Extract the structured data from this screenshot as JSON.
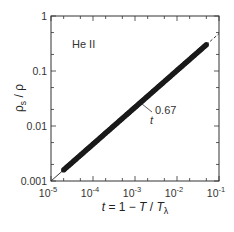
{
  "chart_data": {
    "type": "scatter",
    "title": "",
    "xlabel": "t = 1 − T / Tλ",
    "ylabel": "ρs / ρ",
    "xscale": "log",
    "yscale": "log",
    "xlim": [
      1e-05,
      0.1
    ],
    "ylim": [
      0.001,
      1
    ],
    "grid": false,
    "x_ticks": [
      {
        "value": 1e-05,
        "base": "10",
        "exp": "-5"
      },
      {
        "value": 0.0001,
        "base": "10",
        "exp": "-4"
      },
      {
        "value": 0.001,
        "base": "10",
        "exp": "-3"
      },
      {
        "value": 0.01,
        "base": "10",
        "exp": "-2"
      },
      {
        "value": 0.1,
        "base": "10",
        "exp": "-1"
      }
    ],
    "y_ticks": [
      {
        "value": 0.001,
        "label": "0.001"
      },
      {
        "value": 0.01,
        "label": "0.01"
      },
      {
        "value": 0.1,
        "label": "0.1"
      },
      {
        "value": 1,
        "label": "1"
      }
    ],
    "series": [
      {
        "name": "He II data",
        "kind": "markers",
        "x_range": [
          2e-05,
          0.05
        ],
        "note": "dense filled circles lying on power-law line",
        "points": [
          [
            2e-05,
            0.00157
          ],
          [
            3e-05,
            0.00206
          ],
          [
            5e-05,
            0.0029
          ],
          [
            0.0001,
            0.00458
          ],
          [
            0.0002,
            0.00729
          ],
          [
            0.0003,
            0.00955
          ],
          [
            0.0005,
            0.0134
          ],
          [
            0.001,
            0.0213
          ],
          [
            0.002,
            0.0339
          ],
          [
            0.003,
            0.0444
          ],
          [
            0.005,
            0.0625
          ],
          [
            0.01,
            0.0995
          ],
          [
            0.02,
            0.158
          ],
          [
            0.03,
            0.208
          ],
          [
            0.05,
            0.292
          ]
        ]
      },
      {
        "name": "fit",
        "kind": "line",
        "formula": "ρs/ρ = 2.24 · t^0.67",
        "exponent": 0.67,
        "prefactor": 2.24
      }
    ],
    "annotations": [
      {
        "text": "He II",
        "x": 3e-05,
        "y": 0.5
      },
      {
        "text_base": "t",
        "text_exp": "0.67",
        "x": 0.0018,
        "y": 0.018
      }
    ]
  },
  "labels": {
    "material": "He II",
    "fit_base": "t",
    "fit_exp": "0.67",
    "xlabel_t": "t",
    "xlabel_mid": " = 1 − ",
    "xlabel_T": "T",
    "xlabel_slash": " / ",
    "xlabel_Tl": "T",
    "xlabel_sub": "λ",
    "ylabel_rho_s": "ρ",
    "ylabel_sub": "s",
    "ylabel_rest": " / ρ"
  }
}
